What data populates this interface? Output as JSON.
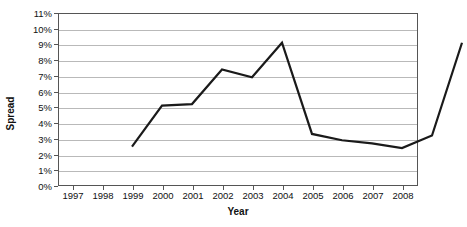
{
  "chart_data": {
    "type": "line",
    "title": "",
    "xlabel": "Year",
    "ylabel": "Spread",
    "categories": [
      "1997",
      "1998",
      "1999",
      "2000",
      "2001",
      "2002",
      "2003",
      "2004",
      "2005",
      "2006",
      "2007",
      "2008"
    ],
    "x": [
      1997,
      1998,
      1999,
      2000,
      2001,
      2002,
      2003,
      2004,
      2005,
      2006,
      2007,
      2008
    ],
    "values": [
      3.4,
      6.0,
      6.1,
      8.3,
      7.8,
      10.0,
      4.2,
      3.8,
      3.6,
      3.3,
      4.1,
      10.0
    ],
    "series": [
      {
        "name": "Spread",
        "values": [
          3.4,
          6.0,
          6.1,
          8.3,
          7.8,
          10.0,
          4.2,
          3.8,
          3.6,
          3.3,
          4.1,
          10.0
        ],
        "color": "#1a1a1a"
      }
    ],
    "ylim": [
      0,
      11
    ],
    "ytick_values": [
      0,
      1,
      2,
      3,
      4,
      5,
      6,
      7,
      8,
      9,
      10,
      11
    ],
    "ytick_labels": [
      "0%",
      "1%",
      "2%",
      "3%",
      "4%",
      "5%",
      "6%",
      "7%",
      "8%",
      "9%",
      "10%",
      "11%"
    ],
    "xtick_labels": [
      "1997",
      "1998",
      "1999",
      "2000",
      "2001",
      "2002",
      "2003",
      "2004",
      "2005",
      "2006",
      "2007",
      "2008"
    ],
    "grid": true,
    "grid_axis": "y",
    "legend": false,
    "legend_position": "none",
    "value_suffix": "%",
    "colors": {
      "line": "#1a1a1a",
      "grid": "#b9b9b9",
      "frame": "#555555",
      "text": "#111111",
      "background": "#ffffff"
    }
  }
}
